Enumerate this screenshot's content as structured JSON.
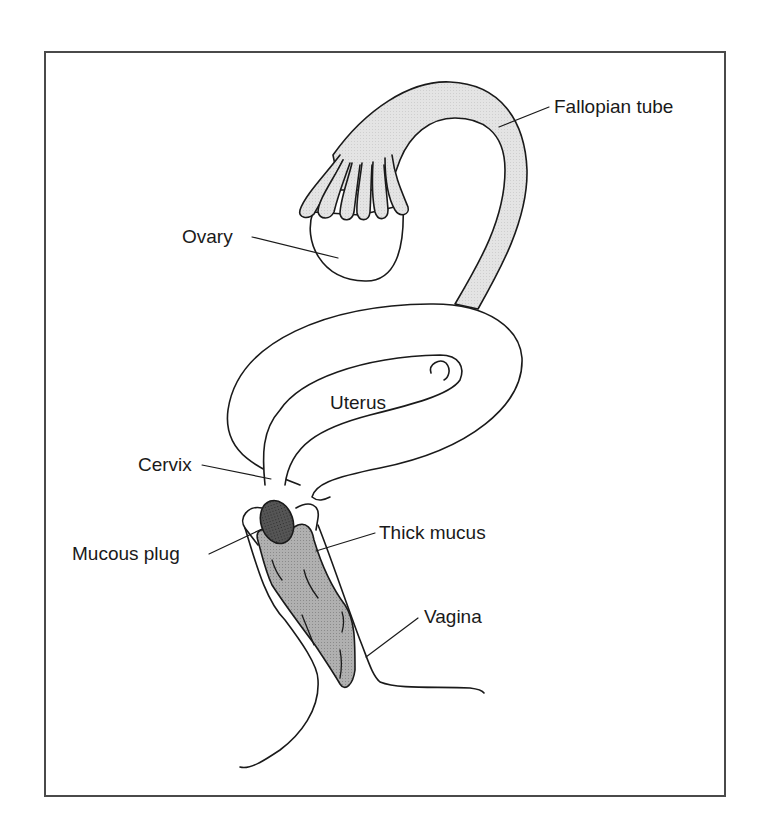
{
  "figure": {
    "type": "anatomical-line-drawing",
    "colors": {
      "outline": "#1a1a1a",
      "tube_fill": "#e6e6e6",
      "plug_fill": "#4a4a4a",
      "mucus_fill": "#aaaaaa",
      "frame": "#4a4a4a",
      "background": "#ffffff"
    },
    "labels": [
      {
        "id": "fallopian-tube",
        "text": "Fallopian tube"
      },
      {
        "id": "ovary",
        "text": "Ovary"
      },
      {
        "id": "uterus",
        "text": "Uterus"
      },
      {
        "id": "cervix",
        "text": "Cervix"
      },
      {
        "id": "mucous-plug",
        "text": "Mucous plug"
      },
      {
        "id": "thick-mucus",
        "text": "Thick mucus"
      },
      {
        "id": "vagina",
        "text": "Vagina"
      }
    ]
  }
}
